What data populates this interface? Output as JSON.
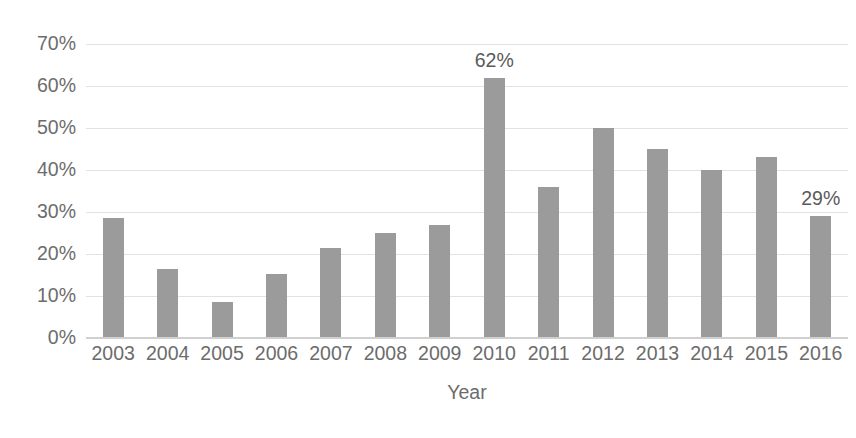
{
  "chart_data": {
    "type": "bar",
    "title": "",
    "xlabel": "Year",
    "ylabel": "",
    "categories": [
      "2003",
      "2004",
      "2005",
      "2006",
      "2007",
      "2008",
      "2009",
      "2010",
      "2011",
      "2012",
      "2013",
      "2014",
      "2015",
      "2016"
    ],
    "values": [
      28.5,
      16.5,
      8.5,
      15.3,
      21.5,
      25.0,
      26.8,
      62.0,
      36.0,
      50.0,
      45.0,
      40.0,
      43.0,
      29.0
    ],
    "ylim": [
      0,
      70
    ],
    "ytick_values": [
      0,
      10,
      20,
      30,
      40,
      50,
      60,
      70
    ],
    "ytick_labels": [
      "0%",
      "10%",
      "20%",
      "30%",
      "40%",
      "50%",
      "60%",
      "70%"
    ],
    "grid": true,
    "legend": false,
    "legend_position": "none",
    "bar_color": "#9b9b9b",
    "gridline_color": "#e2e2e2",
    "text_color": "#6c6c6c",
    "background_color": "#ffffff",
    "annotations": [
      {
        "category": "2010",
        "text": "62%",
        "value": 62.0
      },
      {
        "category": "2016",
        "text": "29%",
        "value": 29.0
      }
    ]
  }
}
